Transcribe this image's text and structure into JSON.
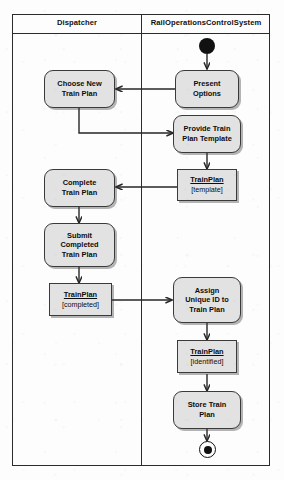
{
  "diagram": {
    "type": "uml-activity-diagram",
    "title": "",
    "lanes": [
      {
        "id": "dispatcher",
        "label": "Dispatcher"
      },
      {
        "id": "rocs",
        "label": "RailOperationsControlSystem"
      }
    ],
    "colors": {
      "node_fill": "#e2e2e2",
      "node_stroke": "#3a3a3a",
      "frame_stroke": "#2b2b2b",
      "edge_stroke": "#262626",
      "background": "#fdfdfd",
      "marker_fill": "#111111"
    },
    "nodes": [
      {
        "id": "initial",
        "kind": "initial-node",
        "lane": "rocs",
        "label": ""
      },
      {
        "id": "present",
        "kind": "action",
        "lane": "rocs",
        "label": "Present\nOptions"
      },
      {
        "id": "choose",
        "kind": "action",
        "lane": "dispatcher",
        "label": "Choose New\nTrain Plan"
      },
      {
        "id": "provide",
        "kind": "action",
        "lane": "rocs",
        "label": "Provide Train\nPlan Template"
      },
      {
        "id": "obj_template",
        "kind": "object",
        "lane": "rocs",
        "name": "TrainPlan",
        "state": "[template]"
      },
      {
        "id": "complete",
        "kind": "action",
        "lane": "dispatcher",
        "label": "Complete\nTrain Plan"
      },
      {
        "id": "submit",
        "kind": "action",
        "lane": "dispatcher",
        "label": "Submit\nCompleted\nTrain Plan"
      },
      {
        "id": "obj_completed",
        "kind": "object",
        "lane": "dispatcher",
        "name": "TrainPlan",
        "state": "[completed]"
      },
      {
        "id": "assign",
        "kind": "action",
        "lane": "rocs",
        "label": "Assign\nUnique ID to\nTrain Plan"
      },
      {
        "id": "obj_identified",
        "kind": "object",
        "lane": "rocs",
        "name": "TrainPlan",
        "state": "[identified]"
      },
      {
        "id": "store",
        "kind": "action",
        "lane": "rocs",
        "label": "Store Train\nPlan"
      },
      {
        "id": "final",
        "kind": "final-node",
        "lane": "rocs",
        "label": ""
      }
    ],
    "edges": [
      {
        "from": "initial",
        "to": "present",
        "style": "straight"
      },
      {
        "from": "present",
        "to": "choose",
        "style": "horizontal"
      },
      {
        "from": "choose",
        "to": "provide",
        "style": "orthogonal"
      },
      {
        "from": "provide",
        "to": "obj_template",
        "style": "straight"
      },
      {
        "from": "obj_template",
        "to": "complete",
        "style": "horizontal"
      },
      {
        "from": "complete",
        "to": "submit",
        "style": "straight"
      },
      {
        "from": "submit",
        "to": "obj_completed",
        "style": "straight"
      },
      {
        "from": "obj_completed",
        "to": "assign",
        "style": "horizontal"
      },
      {
        "from": "assign",
        "to": "obj_identified",
        "style": "straight"
      },
      {
        "from": "obj_identified",
        "to": "store",
        "style": "straight"
      },
      {
        "from": "store",
        "to": "final",
        "style": "straight"
      }
    ]
  }
}
